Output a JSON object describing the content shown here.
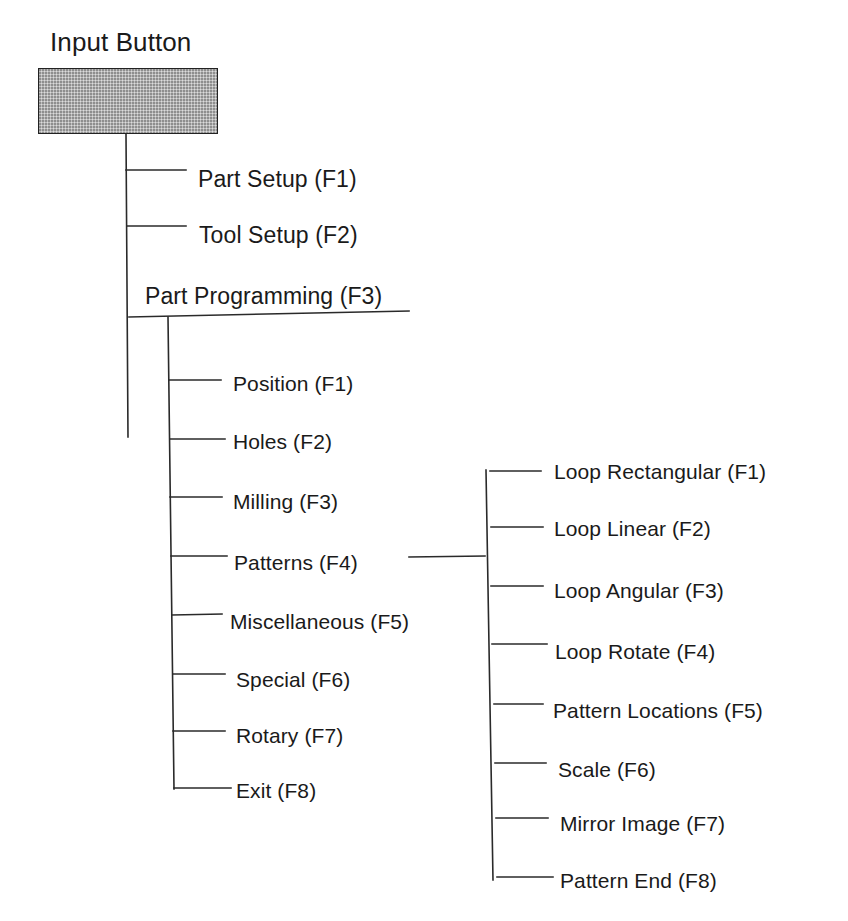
{
  "diagram": {
    "title": "Input Button",
    "button_fill_color": "#bdbdbd",
    "line_color": "#2a2a2a",
    "main_menu": [
      {
        "label": "Part Setup (F1)"
      },
      {
        "label": "Tool Setup (F2)"
      },
      {
        "label": "Part Programming (F3)"
      }
    ],
    "part_programming_menu": [
      {
        "label": "Position (F1)"
      },
      {
        "label": "Holes (F2)"
      },
      {
        "label": "Milling (F3)"
      },
      {
        "label": "Patterns (F4)"
      },
      {
        "label": "Miscellaneous (F5)"
      },
      {
        "label": "Special (F6)"
      },
      {
        "label": "Rotary (F7)"
      },
      {
        "label": "Exit (F8)"
      }
    ],
    "patterns_menu": [
      {
        "label": "Loop Rectangular (F1)"
      },
      {
        "label": "Loop Linear (F2)"
      },
      {
        "label": "Loop Angular (F3)"
      },
      {
        "label": "Loop Rotate (F4)"
      },
      {
        "label": "Pattern Locations (F5)"
      },
      {
        "label": "Scale (F6)"
      },
      {
        "label": "Mirror Image (F7)"
      },
      {
        "label": "Pattern End (F8)"
      }
    ]
  }
}
